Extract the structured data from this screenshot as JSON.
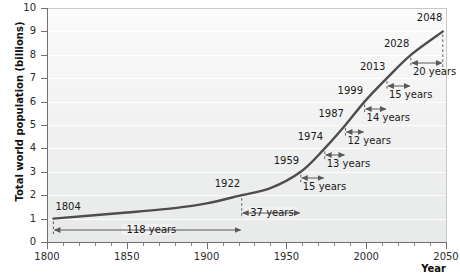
{
  "chart_data": {
    "type": "line",
    "title": "",
    "xlabel": "Year",
    "ylabel": "Total world population (billions)",
    "xlim": [
      1800,
      2050
    ],
    "ylim": [
      0,
      10
    ],
    "xticks": [
      1800,
      1850,
      1900,
      1950,
      2000,
      2050
    ],
    "xtick_labels": [
      "1800",
      "1850",
      "1900",
      "1950",
      "2000",
      "2050"
    ],
    "xtick_minor_step": 10,
    "yticks": [
      0,
      1,
      2,
      3,
      4,
      5,
      6,
      7,
      8,
      9,
      10
    ],
    "ytick_labels": [
      "0",
      "1",
      "2",
      "3",
      "4",
      "5",
      "6",
      "7",
      "8",
      "9",
      "10"
    ],
    "grid": "horizontal",
    "legend": "none",
    "series": [
      {
        "name": "Total world population",
        "color": "#4d4d4d",
        "x": [
          1804,
          1850,
          1880,
          1900,
          1922,
          1940,
          1959,
          1974,
          1987,
          1999,
          2013,
          2028,
          2048
        ],
        "y": [
          1,
          1.26,
          1.45,
          1.65,
          2,
          2.3,
          3,
          4,
          5,
          6,
          7,
          8,
          9
        ]
      }
    ],
    "milestones": [
      {
        "year": 1804,
        "population": 1,
        "label": "1804"
      },
      {
        "year": 1922,
        "population": 2,
        "label": "1922"
      },
      {
        "year": 1959,
        "population": 3,
        "label": "1959"
      },
      {
        "year": 1974,
        "population": 4,
        "label": "1974"
      },
      {
        "year": 1987,
        "population": 5,
        "label": "1987"
      },
      {
        "year": 1999,
        "population": 6,
        "label": "1999"
      },
      {
        "year": 2013,
        "population": 7,
        "label": "2013"
      },
      {
        "year": 2028,
        "population": 8,
        "label": "2028"
      },
      {
        "year": 2048,
        "population": 9,
        "label": "2048"
      }
    ],
    "intervals": [
      {
        "from": 1804,
        "to": 1922,
        "label": "118 years",
        "years": 118
      },
      {
        "from": 1922,
        "to": 1959,
        "label": "37 years",
        "years": 37
      },
      {
        "from": 1959,
        "to": 1974,
        "label": "15 years",
        "years": 15
      },
      {
        "from": 1974,
        "to": 1987,
        "label": "13 years",
        "years": 13
      },
      {
        "from": 1987,
        "to": 1999,
        "label": "12 years",
        "years": 12
      },
      {
        "from": 1999,
        "to": 2013,
        "label": "14 years",
        "years": 14
      },
      {
        "from": 2013,
        "to": 2028,
        "label": "15 years",
        "years": 15
      },
      {
        "from": 2028,
        "to": 2048,
        "label": "20 years",
        "years": 20
      }
    ],
    "colors": {
      "curve": "#4d4d4d",
      "annotation": "#585858",
      "axis": "#6e6e6e",
      "plot_background": "#f2f2f2",
      "gridline": "#ffffff",
      "text": "#1a1a1a"
    }
  }
}
